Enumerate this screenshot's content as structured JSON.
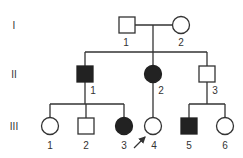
{
  "pedigree": {
    "generations": [
      {
        "label": "I",
        "y": 25
      },
      {
        "label": "II",
        "y": 74
      },
      {
        "label": "III",
        "y": 126
      }
    ],
    "individuals": [
      {
        "id": "I-1",
        "label": "1",
        "sex": "male",
        "affected": false,
        "cx": 127,
        "cy": 25,
        "label_x": 126,
        "label_y": 46
      },
      {
        "id": "I-2",
        "label": "2",
        "sex": "female",
        "affected": false,
        "cx": 181,
        "cy": 25,
        "label_x": 181,
        "label_y": 46
      },
      {
        "id": "II-1",
        "label": "1",
        "sex": "male",
        "affected": true,
        "cx": 85,
        "cy": 74,
        "label_x": 93,
        "label_y": 94
      },
      {
        "id": "II-2",
        "label": "2",
        "sex": "female",
        "affected": true,
        "cx": 153,
        "cy": 74,
        "label_x": 161,
        "label_y": 94
      },
      {
        "id": "II-3",
        "label": "3",
        "sex": "male",
        "affected": false,
        "cx": 207,
        "cy": 74,
        "label_x": 215,
        "label_y": 94
      },
      {
        "id": "III-1",
        "label": "1",
        "sex": "female",
        "affected": false,
        "cx": 50,
        "cy": 126,
        "label_x": 50,
        "label_y": 149
      },
      {
        "id": "III-2",
        "label": "2",
        "sex": "male",
        "affected": false,
        "cx": 86,
        "cy": 126,
        "label_x": 86,
        "label_y": 149
      },
      {
        "id": "III-3",
        "label": "3",
        "sex": "female",
        "affected": true,
        "cx": 124,
        "cy": 126,
        "label_x": 124,
        "label_y": 149
      },
      {
        "id": "III-4",
        "label": "4",
        "sex": "female",
        "affected": false,
        "proband": true,
        "cx": 153,
        "cy": 126,
        "label_x": 154,
        "label_y": 149
      },
      {
        "id": "III-5",
        "label": "5",
        "sex": "male",
        "affected": true,
        "cx": 189,
        "cy": 126,
        "label_x": 189,
        "label_y": 149
      },
      {
        "id": "III-6",
        "label": "6",
        "sex": "female",
        "affected": false,
        "cx": 225,
        "cy": 126,
        "label_x": 225,
        "label_y": 149
      }
    ],
    "proband_arrow": {
      "from": [
        134,
        148
      ],
      "to": [
        146,
        136
      ]
    },
    "colors": {
      "line": "#333333",
      "affected_fill": "#222222",
      "unaffected_fill": "#ffffff"
    }
  }
}
